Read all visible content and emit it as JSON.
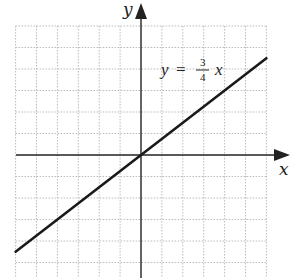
{
  "chart_data": {
    "type": "line",
    "title": "",
    "xlabel": "x",
    "ylabel": "y",
    "equation": {
      "lhs": "y",
      "equals": "=",
      "numerator": "3",
      "denominator": "4",
      "variable": "x"
    },
    "slope": 0.75,
    "intercept": 0,
    "xlim": [
      -6,
      6
    ],
    "ylim": [
      -6,
      6
    ],
    "grid": true,
    "grid_style": "dotted",
    "x": [
      -6,
      6
    ],
    "y": [
      -4.5,
      4.5
    ],
    "tick_labels_visible": false,
    "colors": {
      "line": "#1a1a1a",
      "axis": "#222222",
      "grid": "#bbbbbb"
    }
  }
}
